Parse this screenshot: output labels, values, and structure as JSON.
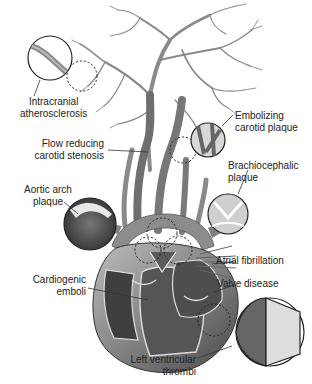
{
  "figure": {
    "colors": {
      "vessel": "#7a7a7a",
      "vessel_dark": "#4a4a4a",
      "heart": "#6e6e6e",
      "outline": "#222222",
      "text": "#222222"
    }
  },
  "labels": {
    "intracranial": {
      "line1": "Intracranial",
      "line2": "atherosclerosis"
    },
    "embolizing": {
      "line1": "Embolizing",
      "line2": "carotid plaque"
    },
    "flow_reducing": {
      "line1": "Flow reducing",
      "line2": "carotid stenosis"
    },
    "brachiocephalic": {
      "line1": "Brachiocephalic",
      "line2": "plaque"
    },
    "aortic_arch": {
      "line1": "Aortic arch",
      "line2": "plaque"
    },
    "atrial_fib": {
      "line1": "Atrial fibrillation"
    },
    "cardiogenic": {
      "line1": "Cardiogenic",
      "line2": "emboli"
    },
    "valve": {
      "line1": "Valve disease"
    },
    "left_ventricular": {
      "line1": "Left ventricular",
      "line2": "thrombi"
    }
  }
}
